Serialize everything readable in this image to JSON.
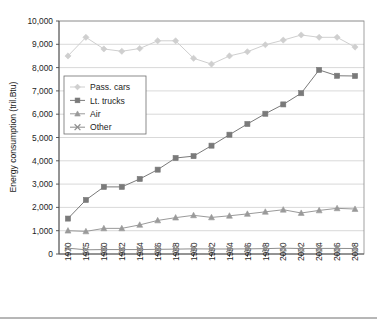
{
  "chart_data": {
    "type": "line",
    "title": "",
    "xlabel": "",
    "ylabel": "Energy consumption (tril.Btu)",
    "x": [
      1970,
      1975,
      1980,
      1982,
      1984,
      1986,
      1988,
      1990,
      1992,
      1994,
      1996,
      1998,
      2000,
      2002,
      2004,
      2006,
      2008
    ],
    "categories": [
      "1970",
      "1975",
      "1980",
      "1982",
      "1984",
      "1986",
      "1988",
      "1990",
      "1992",
      "1994",
      "1996",
      "1998",
      "2000",
      "2002",
      "2004",
      "2006",
      "2008"
    ],
    "ylim": [
      0,
      10000
    ],
    "yticks": [
      0,
      1000,
      2000,
      3000,
      4000,
      5000,
      6000,
      7000,
      8000,
      9000,
      10000
    ],
    "ytick_labels": [
      "0",
      "1,000",
      "2,000",
      "3,000",
      "4,000",
      "5,000",
      "6,000",
      "7,000",
      "8,000",
      "9,000",
      "10,000"
    ],
    "grid": true,
    "legend_position": "upper-left-inside",
    "series": [
      {
        "name": "Pass. cars",
        "marker": "diamond",
        "color": "#cfcfcf",
        "line_color": "#cfcfcf",
        "values": [
          8500,
          9300,
          8800,
          8700,
          8820,
          9150,
          9150,
          8400,
          8150,
          8500,
          8680,
          8980,
          9180,
          9400,
          9300,
          9300,
          8880
        ]
      },
      {
        "name": "Lt. trucks",
        "marker": "square",
        "color": "#7a7a7a",
        "line_color": "#7a7a7a",
        "values": [
          1520,
          2320,
          2880,
          2880,
          3220,
          3620,
          4120,
          4200,
          4650,
          5120,
          5580,
          6020,
          6420,
          6900,
          7900,
          7650,
          7640
        ]
      },
      {
        "name": "Air",
        "marker": "triangle",
        "color": "#9a9a9a",
        "line_color": "#9a9a9a",
        "values": [
          1000,
          970,
          1100,
          1100,
          1250,
          1440,
          1560,
          1660,
          1570,
          1640,
          1720,
          1810,
          1900,
          1760,
          1870,
          1960,
          1930
        ]
      },
      {
        "name": "Other",
        "marker": "cross",
        "color": "#8e8e8e",
        "line_color": "#8e8e8e",
        "values": [
          250,
          180,
          190,
          190,
          190,
          200,
          210,
          220,
          215,
          215,
          220,
          230,
          250,
          235,
          240,
          240,
          235
        ]
      }
    ]
  },
  "legend": {
    "items": [
      {
        "label": "Pass. cars"
      },
      {
        "label": "Lt. trucks"
      },
      {
        "label": "Air"
      },
      {
        "label": "Other"
      }
    ]
  },
  "caption": {
    "text": ""
  }
}
